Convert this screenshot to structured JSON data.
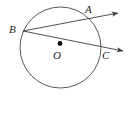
{
  "figure": {
    "kind": "circle-geometry-diagram",
    "background_color": "#ffffff",
    "stroke_color": "#3a3a3a",
    "label_color": "#1a1a1a",
    "canvas": {
      "width": 133,
      "height": 114
    },
    "circle": {
      "cx": 60.5,
      "cy": 47.5,
      "r": 40.5
    },
    "center_dot": {
      "cx": 60.0,
      "cy": 43.5,
      "r": 2.4,
      "fill": "#111111"
    },
    "labels": {
      "a": "A",
      "b": "B",
      "c": "C",
      "o": "O"
    },
    "points": {
      "a": {
        "x": 92.0,
        "y": 18.0
      },
      "b": {
        "x": 23.0,
        "y": 31.0
      },
      "c": {
        "x": 99.5,
        "y": 47.0
      },
      "o": {
        "x": 60.0,
        "y": 43.5
      }
    },
    "rays": [
      {
        "name": "ray-BA",
        "from": {
          "x": 23.0,
          "y": 31.0
        },
        "through": {
          "x": 92.0,
          "y": 18.0
        },
        "tip": {
          "x": 120.0,
          "y": 12.5
        }
      },
      {
        "name": "ray-BC",
        "from": {
          "x": 23.0,
          "y": 31.0
        },
        "through": {
          "x": 99.5,
          "y": 47.0
        },
        "tip": {
          "x": 125.0,
          "y": 51.5
        }
      }
    ]
  }
}
